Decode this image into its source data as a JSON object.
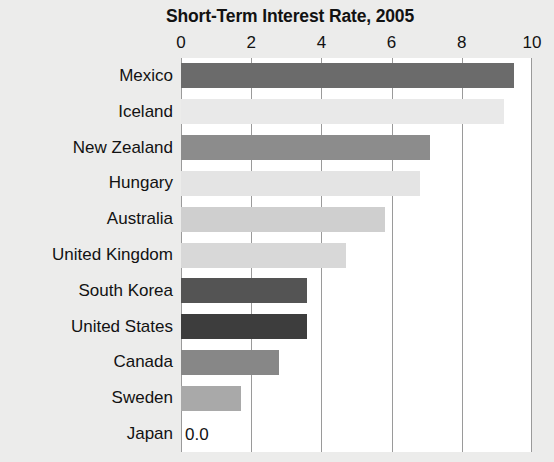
{
  "chart_data": {
    "type": "bar",
    "orientation": "horizontal",
    "title": "Short-Term Interest Rate, 2005",
    "xlabel": "",
    "ylabel": "",
    "xlim": [
      0,
      10
    ],
    "xticks": [
      "0",
      "2",
      "4",
      "6",
      "8",
      "10"
    ],
    "xtick_values": [
      0,
      2,
      4,
      6,
      8,
      10
    ],
    "grid": true,
    "legend": "none",
    "categories": [
      "Mexico",
      "Iceland",
      "New Zealand",
      "Hungary",
      "Australia",
      "United Kingdom",
      "South Korea",
      "United States",
      "Canada",
      "Sweden",
      "Japan"
    ],
    "values": [
      9.5,
      9.2,
      7.1,
      6.8,
      5.8,
      4.7,
      3.6,
      3.6,
      2.8,
      1.7,
      0.0
    ],
    "bar_colors": [
      "#6b6b6b",
      "#e9e9e9",
      "#8c8c8c",
      "#e4e4e4",
      "#cfcfcf",
      "#d8d8d8",
      "#545454",
      "#3d3d3d",
      "#878787",
      "#a9a9a9",
      "#ffffff"
    ],
    "data_labels": [
      "",
      "",
      "",
      "",
      "",
      "",
      "",
      "",
      "",
      "",
      "0.0"
    ]
  },
  "style": {
    "page_background": "#ececeb",
    "plot_background": "#ffffff",
    "gridline_color": "#9a9a9a",
    "text_color": "#121212"
  }
}
